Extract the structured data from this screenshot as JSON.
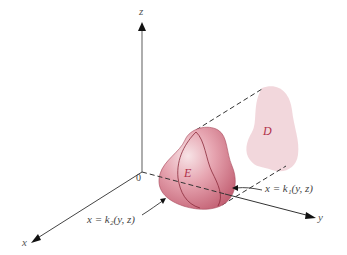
{
  "diagram": {
    "axes": {
      "z_label": "z",
      "x_label": "x",
      "y_label": "y",
      "origin_label": "0"
    },
    "regions": {
      "solid_label": "E",
      "projection_label": "D"
    },
    "annotations": {
      "front_surface": "x = k₁(y, z)",
      "back_surface": "x = k₂(y, z)"
    },
    "colors": {
      "solid_fill": "#d9808f",
      "solid_edge": "#8a2a3a",
      "projection_fill": "#f1d3d8",
      "label_color": "#b0304a",
      "axis_color": "#333333"
    }
  }
}
